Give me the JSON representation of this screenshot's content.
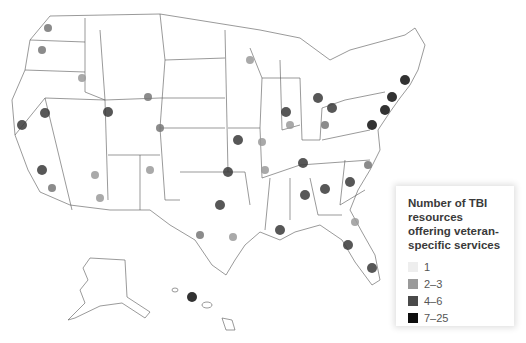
{
  "legend": {
    "title": "Number of TBI resources offering veteran-specific services",
    "items": [
      {
        "label": "1",
        "color": "#eeeeee"
      },
      {
        "label": "2–3",
        "color": "#9a9a9a"
      },
      {
        "label": "4–6",
        "color": "#4a4a4a"
      },
      {
        "label": "7–25",
        "color": "#0e0e0e"
      }
    ]
  },
  "map": {
    "region": "United States (contiguous states, Alaska, Hawaii)",
    "state_border_color": "#555555",
    "hotspots": [
      {
        "name": "Seattle",
        "x": 48,
        "y": 28,
        "level": 3
      },
      {
        "name": "Portland",
        "x": 42,
        "y": 50,
        "level": 3
      },
      {
        "name": "Boise",
        "x": 82,
        "y": 78,
        "level": 2
      },
      {
        "name": "SF Bay",
        "x": 22,
        "y": 125,
        "level": 4
      },
      {
        "name": "Reno",
        "x": 45,
        "y": 113,
        "level": 4
      },
      {
        "name": "Salt Lake",
        "x": 108,
        "y": 112,
        "level": 4
      },
      {
        "name": "Cheyenne area",
        "x": 148,
        "y": 97,
        "level": 3
      },
      {
        "name": "Denver",
        "x": 160,
        "y": 128,
        "level": 3
      },
      {
        "name": "Los Angeles",
        "x": 42,
        "y": 170,
        "level": 4
      },
      {
        "name": "San Diego",
        "x": 52,
        "y": 188,
        "level": 3
      },
      {
        "name": "Phoenix",
        "x": 95,
        "y": 175,
        "level": 2
      },
      {
        "name": "Tucson",
        "x": 100,
        "y": 198,
        "level": 2
      },
      {
        "name": "Albuquerque",
        "x": 150,
        "y": 170,
        "level": 2
      },
      {
        "name": "Dallas",
        "x": 220,
        "y": 205,
        "level": 4
      },
      {
        "name": "Oklahoma City",
        "x": 228,
        "y": 172,
        "level": 4
      },
      {
        "name": "San Antonio",
        "x": 200,
        "y": 235,
        "level": 3
      },
      {
        "name": "Houston",
        "x": 233,
        "y": 237,
        "level": 2
      },
      {
        "name": "Kansas City",
        "x": 238,
        "y": 140,
        "level": 4
      },
      {
        "name": "Minneapolis",
        "x": 250,
        "y": 60,
        "level": 2
      },
      {
        "name": "Chicago",
        "x": 286,
        "y": 112,
        "level": 4
      },
      {
        "name": "Detroit",
        "x": 318,
        "y": 98,
        "level": 4
      },
      {
        "name": "Cleveland",
        "x": 332,
        "y": 108,
        "level": 4
      },
      {
        "name": "Columbus",
        "x": 325,
        "y": 125,
        "level": 3
      },
      {
        "name": "Indianapolis",
        "x": 290,
        "y": 125,
        "level": 2
      },
      {
        "name": "St. Louis",
        "x": 262,
        "y": 142,
        "level": 2
      },
      {
        "name": "Nashville",
        "x": 303,
        "y": 163,
        "level": 4
      },
      {
        "name": "Memphis",
        "x": 265,
        "y": 170,
        "level": 2
      },
      {
        "name": "Birmingham",
        "x": 305,
        "y": 195,
        "level": 4
      },
      {
        "name": "Atlanta",
        "x": 325,
        "y": 189,
        "level": 4
      },
      {
        "name": "Charlotte",
        "x": 350,
        "y": 182,
        "level": 4
      },
      {
        "name": "Raleigh",
        "x": 368,
        "y": 165,
        "level": 3
      },
      {
        "name": "New Orleans",
        "x": 280,
        "y": 230,
        "level": 4
      },
      {
        "name": "Tampa",
        "x": 348,
        "y": 245,
        "level": 4
      },
      {
        "name": "Miami",
        "x": 372,
        "y": 268,
        "level": 4
      },
      {
        "name": "Jacksonville",
        "x": 355,
        "y": 222,
        "level": 2
      },
      {
        "name": "Washington DC",
        "x": 372,
        "y": 125,
        "level": 5
      },
      {
        "name": "Philadelphia",
        "x": 385,
        "y": 110,
        "level": 5
      },
      {
        "name": "New York",
        "x": 392,
        "y": 97,
        "level": 5
      },
      {
        "name": "Boston",
        "x": 405,
        "y": 80,
        "level": 5
      },
      {
        "name": "Hawaii",
        "x": 192,
        "y": 297,
        "level": 5
      }
    ]
  }
}
